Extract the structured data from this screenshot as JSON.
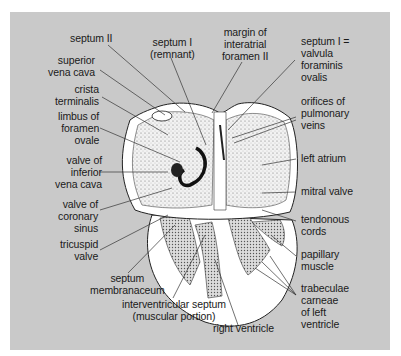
{
  "figure": {
    "background_color": "#c9c9c9",
    "labels": {
      "septum_ii": "septum II",
      "septum_i_remnant": "septum I\n(remnant)",
      "margin_interatrial_foramen": "margin of\ninteratrial\nforamen II",
      "septum_i_valvula": "septum I =\nvalvula\nforaminis\novalis",
      "superior_vena_cava": "superior\nvena cava",
      "crista_terminalis": "crista\nterminalis",
      "limbus_foramen_ovale": "limbus of\nforamen\novale",
      "valve_inferior_vena_cava": "valve of\ninferior\nvena cava",
      "valve_coronary_sinus": "valve of\ncoronary\nsinus",
      "tricuspid_valve": "tricuspid\nvalve",
      "septum_membranaceum": "septum\nmembranaceum",
      "interventricular_septum": "interventricular septum\n(muscular portion)",
      "right_ventricle": "right ventricle",
      "orifices_pulmonary_veins": "orifices of\npulmonary\nveins",
      "left_atrium": "left atrium",
      "mitral_valve": "mitral valve",
      "tendonous_cords": "tendonous\ncords",
      "papillary_muscle": "papillary\nmuscle",
      "trabeculae_carneae": "trabeculae\ncarneae\nof left\nventricle"
    }
  }
}
